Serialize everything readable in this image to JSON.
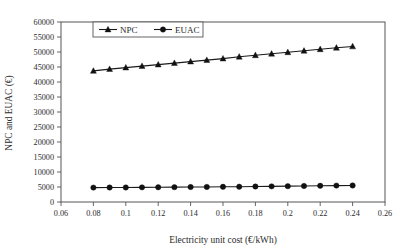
{
  "chart_data": {
    "type": "line",
    "title": "",
    "xlabel": "Electricity unit cost (€/kWh)",
    "ylabel": "NPC and EUAC (€)",
    "xlim": [
      0.06,
      0.26
    ],
    "ylim": [
      0,
      60000
    ],
    "xticks": [
      "0.06",
      "0.08",
      "0.1",
      "0.12",
      "0.14",
      "0.16",
      "0.18",
      "0.2",
      "0.22",
      "0.24",
      "0.26"
    ],
    "xtick_values": [
      0.06,
      0.08,
      0.1,
      0.12,
      0.14,
      0.16,
      0.18,
      0.2,
      0.22,
      0.24,
      0.26
    ],
    "yticks": [
      "0",
      "5000",
      "10000",
      "15000",
      "20000",
      "25000",
      "30000",
      "35000",
      "40000",
      "45000",
      "50000",
      "55000",
      "60000"
    ],
    "ytick_values": [
      0,
      5000,
      10000,
      15000,
      20000,
      25000,
      30000,
      35000,
      40000,
      45000,
      50000,
      55000,
      60000
    ],
    "grid": false,
    "legend_position": "top-left-inside",
    "x": [
      0.08,
      0.09,
      0.1,
      0.11,
      0.12,
      0.13,
      0.14,
      0.15,
      0.16,
      0.17,
      0.18,
      0.19,
      0.2,
      0.21,
      0.22,
      0.23,
      0.24
    ],
    "series": [
      {
        "name": "NPC",
        "marker": "triangle",
        "color": "#111111",
        "values": [
          43700,
          44300,
          44800,
          45300,
          45800,
          46300,
          46800,
          47300,
          47800,
          48400,
          48900,
          49400,
          49900,
          50400,
          50900,
          51400,
          51850
        ]
      },
      {
        "name": "EUAC",
        "marker": "circle",
        "color": "#111111",
        "values": [
          4800,
          4820,
          4840,
          4880,
          4900,
          4950,
          4980,
          5020,
          5060,
          5100,
          5160,
          5220,
          5280,
          5340,
          5400,
          5470,
          5520
        ]
      }
    ]
  },
  "legend": {
    "items": [
      {
        "label": "NPC",
        "marker": "triangle"
      },
      {
        "label": "EUAC",
        "marker": "circle"
      }
    ]
  },
  "axes": {
    "x_title": "Electricity unit cost (€/kWh)",
    "y_title": "NPC and EUAC (€)"
  }
}
